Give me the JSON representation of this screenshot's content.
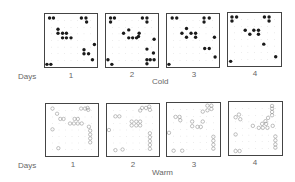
{
  "figure": {
    "row_labels": {
      "days": "Days"
    },
    "rows": [
      {
        "condition": "Cold",
        "marker": "filled",
        "panels": [
          {
            "day": "1",
            "points": [
              [
                0.7,
                0.6
              ],
              [
                1.3,
                0.6
              ],
              [
                5.6,
                0.6
              ],
              [
                6.3,
                0.6
              ],
              [
                6.4,
                1.2
              ],
              [
                2.0,
                2.3
              ],
              [
                2.0,
                2.9
              ],
              [
                2.7,
                2.9
              ],
              [
                3.3,
                2.9
              ],
              [
                2.7,
                3.6
              ],
              [
                3.3,
                3.6
              ],
              [
                4.0,
                3.6
              ],
              [
                7.6,
                4.6
              ],
              [
                6.0,
                5.4
              ],
              [
                6.0,
                6.0
              ],
              [
                6.7,
                6.0
              ],
              [
                7.3,
                6.9
              ],
              [
                0.3,
                7.6
              ],
              [
                0.9,
                7.6
              ]
            ]
          },
          {
            "day": "2",
            "points": [
              [
                0.7,
                0.6
              ],
              [
                1.3,
                0.6
              ],
              [
                0.7,
                1.2
              ],
              [
                5.6,
                0.6
              ],
              [
                6.3,
                0.6
              ],
              [
                6.3,
                1.2
              ],
              [
                3.5,
                2.4
              ],
              [
                2.7,
                2.9
              ],
              [
                5.1,
                2.9
              ],
              [
                3.5,
                3.6
              ],
              [
                4.1,
                3.6
              ],
              [
                4.7,
                3.6
              ],
              [
                5.0,
                3.4
              ],
              [
                7.4,
                3.8
              ],
              [
                6.3,
                5.3
              ],
              [
                0.3,
                6.9
              ],
              [
                7.3,
                5.9
              ],
              [
                0.9,
                7.6
              ],
              [
                6.3,
                6.9
              ],
              [
                6.3,
                7.5
              ],
              [
                6.8,
                6.9
              ],
              [
                7.4,
                6.9
              ]
            ]
          },
          {
            "day": "3",
            "points": [
              [
                0.8,
                0.6
              ],
              [
                1.5,
                0.6
              ],
              [
                5.7,
                0.6
              ],
              [
                6.5,
                0.6
              ],
              [
                5.7,
                1.2
              ],
              [
                3.0,
                2.2
              ],
              [
                2.3,
                2.9
              ],
              [
                3.7,
                2.9
              ],
              [
                4.4,
                2.9
              ],
              [
                3.0,
                3.5
              ],
              [
                4.4,
                3.5
              ],
              [
                7.3,
                3.5
              ],
              [
                5.8,
                5.2
              ],
              [
                6.5,
                5.2
              ],
              [
                7.4,
                6.5
              ],
              [
                0.3,
                7.6
              ]
            ]
          },
          {
            "day": "4",
            "points": [
              [
                0.6,
                0.6
              ],
              [
                1.3,
                0.6
              ],
              [
                0.6,
                1.2
              ],
              [
                5.5,
                0.6
              ],
              [
                6.2,
                0.6
              ],
              [
                6.2,
                1.2
              ],
              [
                2.6,
                2.6
              ],
              [
                3.9,
                2.6
              ],
              [
                4.6,
                2.6
              ],
              [
                3.3,
                3.2
              ],
              [
                4.6,
                3.2
              ],
              [
                5.4,
                4.7
              ],
              [
                7.2,
                6.6
              ],
              [
                0.4,
                7.3
              ]
            ]
          }
        ]
      },
      {
        "condition": "Warm",
        "marker": "open",
        "panels": [
          {
            "day": "1",
            "points": [
              [
                1.0,
                0.7
              ],
              [
                5.4,
                0.7
              ],
              [
                6.0,
                0.7
              ],
              [
                6.4,
                0.6
              ],
              [
                6.5,
                0.9
              ],
              [
                1.7,
                1.5
              ],
              [
                2.2,
                2.3
              ],
              [
                2.7,
                2.3
              ],
              [
                4.4,
                2.3
              ],
              [
                4.9,
                2.3
              ],
              [
                3.7,
                3.0
              ],
              [
                4.3,
                3.0
              ],
              [
                4.9,
                3.0
              ],
              [
                5.5,
                3.0
              ],
              [
                6.6,
                3.5
              ],
              [
                1.0,
                3.9
              ],
              [
                6.8,
                4.1
              ],
              [
                6.8,
                4.7
              ],
              [
                6.8,
                5.3
              ],
              [
                6.8,
                5.9
              ],
              [
                1.9,
                6.8
              ]
            ]
          },
          {
            "day": "2",
            "points": [
              [
                5.4,
                0.6
              ],
              [
                6.0,
                0.6
              ],
              [
                6.5,
                0.4
              ],
              [
                6.6,
                0.9
              ],
              [
                5.1,
                1.0
              ],
              [
                1.3,
                1.9
              ],
              [
                1.9,
                1.9
              ],
              [
                3.8,
                2.7
              ],
              [
                4.5,
                2.7
              ],
              [
                5.1,
                2.7
              ],
              [
                3.8,
                3.3
              ],
              [
                4.5,
                3.3
              ],
              [
                5.1,
                3.3
              ],
              [
                0.3,
                4.0
              ],
              [
                6.6,
                4.5
              ],
              [
                6.6,
                5.1
              ],
              [
                6.6,
                5.7
              ],
              [
                6.6,
                6.3
              ],
              [
                6.6,
                6.9
              ],
              [
                1.3,
                7.1
              ],
              [
                2.4,
                7.0
              ]
            ]
          },
          {
            "day": "3",
            "points": [
              [
                6.1,
                0.4
              ],
              [
                6.7,
                0.4
              ],
              [
                6.7,
                0.9
              ],
              [
                6.1,
                1.1
              ],
              [
                5.4,
                1.3
              ],
              [
                1.3,
                2.1
              ],
              [
                1.9,
                2.1
              ],
              [
                2.0,
                2.6
              ],
              [
                3.8,
                2.8
              ],
              [
                3.8,
                3.5
              ],
              [
                5.4,
                2.8
              ],
              [
                4.6,
                3.6
              ],
              [
                5.1,
                3.6
              ],
              [
                0.3,
                4.5
              ],
              [
                7.0,
                5.1
              ],
              [
                7.0,
                5.7
              ],
              [
                7.0,
                6.3
              ],
              [
                7.0,
                6.9
              ],
              [
                1.0,
                7.2
              ],
              [
                2.3,
                7.2
              ]
            ]
          },
          {
            "day": "4",
            "points": [
              [
                6.5,
                0.6
              ],
              [
                6.5,
                1.0
              ],
              [
                6.5,
                1.5
              ],
              [
                6.5,
                2.0
              ],
              [
                5.9,
                2.4
              ],
              [
                5.5,
                2.9
              ],
              [
                1.0,
                2.3
              ],
              [
                1.5,
                1.9
              ],
              [
                1.7,
                2.6
              ],
              [
                5.0,
                3.3
              ],
              [
                5.6,
                3.3
              ],
              [
                3.6,
                3.6
              ],
              [
                4.5,
                3.9
              ],
              [
                5.1,
                3.9
              ],
              [
                5.8,
                3.9
              ],
              [
                6.6,
                3.6
              ],
              [
                1.0,
                4.9
              ],
              [
                7.0,
                5.2
              ],
              [
                7.0,
                5.8
              ],
              [
                7.0,
                6.4
              ],
              [
                7.0,
                6.9
              ],
              [
                1.0,
                7.4
              ],
              [
                1.6,
                7.4
              ]
            ]
          }
        ]
      }
    ],
    "grid_divisions": 8,
    "colors": {
      "frame": "#444444",
      "marker": "#1a1a1a",
      "open_marker": "#777777",
      "tick": "#bbbbbb"
    }
  }
}
